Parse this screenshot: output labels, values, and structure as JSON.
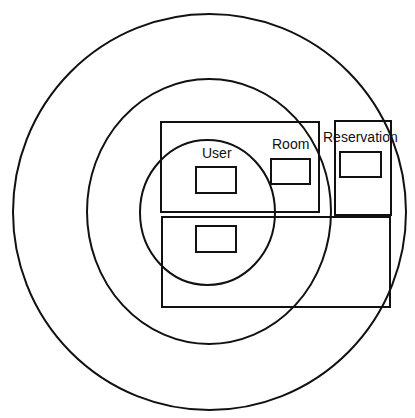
{
  "diagram": {
    "type": "nested-scope-diagram",
    "stroke_color": "#111111",
    "background": "#ffffff",
    "rings": [
      {
        "name": "outer-ring",
        "cx": 209.5,
        "cy": 212,
        "rx": 196.5,
        "ry": 198
      },
      {
        "name": "middle-ring",
        "cx": 209,
        "cy": 211.5,
        "rx": 122,
        "ry": 132.5
      },
      {
        "name": "inner-ring",
        "cx": 207.5,
        "cy": 212.5,
        "rx": 67.5,
        "ry": 72.5
      }
    ],
    "regions": [
      {
        "name": "user-room-region",
        "x": 161,
        "y": 122,
        "w": 158,
        "h": 90
      },
      {
        "name": "reservation-region",
        "x": 335,
        "y": 121,
        "w": 56,
        "h": 94
      },
      {
        "name": "lower-region",
        "x": 162,
        "y": 217,
        "w": 228,
        "h": 90
      }
    ],
    "entities": [
      {
        "label": "User",
        "label_x": 202,
        "label_y": 158,
        "box": {
          "x": 196,
          "y": 167,
          "w": 40,
          "h": 26
        }
      },
      {
        "label": "Room",
        "label_x": 272,
        "label_y": 149,
        "box": {
          "x": 271,
          "y": 159,
          "w": 39,
          "h": 25
        }
      },
      {
        "label": "Reservation",
        "label_x": 323,
        "label_y": 142,
        "box": {
          "x": 340,
          "y": 152,
          "w": 41,
          "h": 25
        }
      },
      {
        "label": "",
        "box": {
          "x": 196,
          "y": 226,
          "w": 40,
          "h": 26
        }
      }
    ]
  }
}
